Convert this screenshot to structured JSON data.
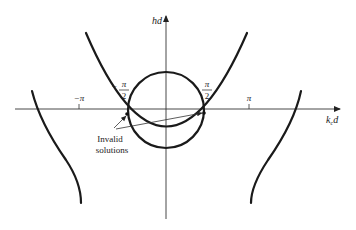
{
  "figure": {
    "axes": {
      "y_label": "hd",
      "x_label_main": "k",
      "x_label_sub": "c",
      "x_label_tail": "d"
    },
    "ticks": [
      {
        "label": "−π",
        "position": "-pi"
      },
      {
        "label": "π",
        "position": "pi"
      }
    ],
    "fraction_ticks": [
      {
        "sign": "−",
        "numerator": "π",
        "denominator": "2",
        "position": "-pi/2"
      },
      {
        "sign": "",
        "numerator": "π",
        "denominator": "2",
        "position": "pi/2"
      }
    ],
    "annotation": {
      "line1": "Invalid",
      "line2": "solutions"
    },
    "curves": [
      "circle",
      "parabola",
      "left-branch",
      "right-branch"
    ],
    "colors": {
      "curve": "#1a1a1a",
      "axis": "#333333",
      "background": "#ffffff"
    }
  }
}
